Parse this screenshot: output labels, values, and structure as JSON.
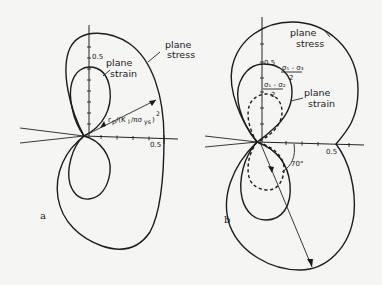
{
  "figure_a": {
    "panel_label": "a",
    "curves": [
      {
        "name": "plane stress",
        "label_line1": "plane",
        "label_line2": "stress"
      },
      {
        "name": "plane strain",
        "label_line1": "plane",
        "label_line2": "strain"
      }
    ],
    "y_tick_label": "0.5",
    "x_tick_label": "0.5",
    "radius_label_main": "r",
    "radius_label_sub": "p",
    "radius_label_rest": "/(K",
    "radius_label_k_sub": "I",
    "radius_label_tail": "/πσ",
    "radius_label_ys": "ys",
    "radius_label_close": ")",
    "radius_label_exp": "2"
  },
  "figure_b": {
    "panel_label": "b",
    "curves": [
      {
        "name": "plane stress",
        "label_line1": "plane",
        "label_line2": "stress"
      },
      {
        "name": "plane strain",
        "label_line1": "plane",
        "label_line2": "strain"
      }
    ],
    "y_tick_label": "0.5",
    "x_tick_label": "0.5",
    "criterion_1_num": "σ₁ - σ₃",
    "criterion_1_den": "2",
    "criterion_2_num": "σ₁ - σ₂",
    "criterion_2_den": "2",
    "angle_label": "70°"
  }
}
